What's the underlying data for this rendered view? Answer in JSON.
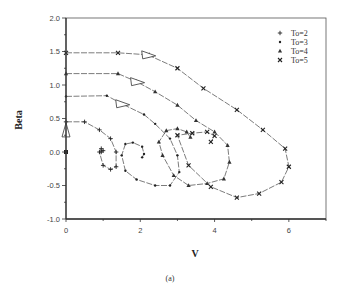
{
  "figure": {
    "caption": "(a)"
  },
  "chart_data": {
    "type": "line",
    "title": "",
    "xlabel": "V",
    "ylabel": "Beta",
    "xlim": [
      0,
      7
    ],
    "ylim": [
      -1.0,
      2.0
    ],
    "xticks": [
      0,
      2,
      4,
      6
    ],
    "xtick_labels": [
      "0",
      "2",
      "4",
      "6"
    ],
    "yticks": [
      -1.0,
      -0.5,
      0.0,
      0.5,
      1.0,
      1.5,
      2.0
    ],
    "ytick_labels": [
      "-1.0",
      "-0.5",
      "0.0",
      "0.5",
      "1.0",
      "1.5",
      "2.0"
    ],
    "grid": false,
    "legend_position": "upper right",
    "series": [
      {
        "name": "To=2",
        "marker": "+",
        "x": [
          0,
          0.5,
          0.9,
          1.2,
          1.35,
          1.35,
          1.2,
          1.0,
          0.9,
          0.95,
          1.0,
          0.95
        ],
        "y": [
          0.45,
          0.45,
          0.33,
          0.2,
          0.0,
          -0.22,
          -0.26,
          -0.2,
          0.0,
          0.05,
          0.02,
          0.0
        ]
      },
      {
        "name": "To=3",
        "marker": "•",
        "x": [
          0,
          1.1,
          1.5,
          2.1,
          2.4,
          2.8,
          3.0,
          3.05,
          2.8,
          2.4,
          1.9,
          1.6,
          1.5,
          1.6,
          1.8,
          2.05,
          2.1,
          2.05
        ],
        "y": [
          0.83,
          0.84,
          0.72,
          0.56,
          0.42,
          0.2,
          -0.05,
          -0.3,
          -0.5,
          -0.5,
          -0.41,
          -0.28,
          -0.05,
          0.12,
          0.14,
          0.08,
          -0.03,
          -0.08
        ]
      },
      {
        "name": "To=4",
        "marker": "△",
        "x": [
          0,
          1.4,
          1.9,
          2.4,
          3.0,
          3.5,
          4.0,
          4.35,
          4.4,
          4.25,
          3.8,
          3.3,
          2.9,
          2.6,
          2.5,
          2.7,
          3.0,
          3.25,
          3.35
        ],
        "y": [
          1.17,
          1.17,
          1.05,
          0.9,
          0.7,
          0.47,
          0.3,
          0.1,
          -0.15,
          -0.4,
          -0.47,
          -0.5,
          -0.35,
          -0.05,
          0.15,
          0.32,
          0.35,
          0.3,
          0.22
        ]
      },
      {
        "name": "To=5",
        "marker": "×",
        "x": [
          0,
          1.4,
          2.2,
          3.0,
          3.7,
          4.6,
          5.3,
          5.9,
          6.0,
          5.8,
          5.2,
          4.6,
          3.9,
          3.3,
          3.0,
          3.4,
          3.8,
          4.0,
          3.9
        ],
        "y": [
          1.48,
          1.48,
          1.45,
          1.25,
          0.95,
          0.63,
          0.33,
          0.05,
          -0.22,
          -0.45,
          -0.62,
          -0.68,
          -0.52,
          -0.2,
          0.25,
          0.28,
          0.3,
          0.24,
          0.15
        ]
      }
    ],
    "annotations": [
      {
        "type": "arrow-triangle",
        "x": 0,
        "y": 0.3,
        "direction": "up"
      },
      {
        "type": "arrow-triangle",
        "x": 2.2,
        "y": 1.45,
        "direction": "right"
      },
      {
        "type": "arrow-triangle",
        "x": 1.9,
        "y": 1.05,
        "direction": "right"
      },
      {
        "type": "arrow-triangle",
        "x": 1.5,
        "y": 0.72,
        "direction": "right"
      },
      {
        "type": "point",
        "x": 0,
        "y": 0.0,
        "marker": "■"
      }
    ]
  }
}
